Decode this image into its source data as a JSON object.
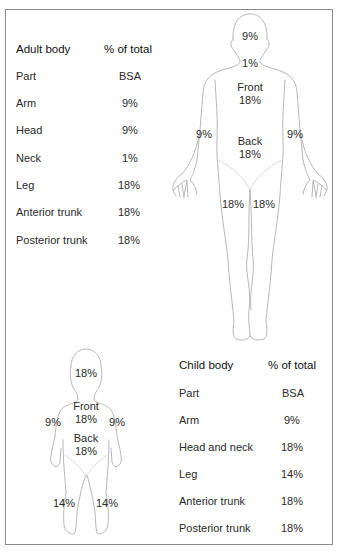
{
  "adult_table": {
    "header": {
      "part": "Adult body",
      "value": "% of total"
    },
    "subheader": {
      "part": "Part",
      "value": "BSA"
    },
    "rows": [
      {
        "part": "Arm",
        "value": "9%"
      },
      {
        "part": "Head",
        "value": "9%"
      },
      {
        "part": "Neck",
        "value": "1%"
      },
      {
        "part": "Leg",
        "value": "18%"
      },
      {
        "part": "Anterior trunk",
        "value": "18%"
      },
      {
        "part": "Posterior trunk",
        "value": "18%"
      }
    ]
  },
  "child_table": {
    "header": {
      "part": "Child body",
      "value": "% of total"
    },
    "subheader": {
      "part": "Part",
      "value": "BSA"
    },
    "rows": [
      {
        "part": "Arm",
        "value": "9%"
      },
      {
        "part": "Head and neck",
        "value": "18%"
      },
      {
        "part": "Leg",
        "value": "14%"
      },
      {
        "part": "Anterior trunk",
        "value": "18%"
      },
      {
        "part": "Posterior trunk",
        "value": "18%"
      }
    ]
  },
  "adult_figure": {
    "head": "9%",
    "neck": "1%",
    "front_label": "Front",
    "front_value": "18%",
    "back_label": "Back",
    "back_value": "18%",
    "left_arm": "9%",
    "right_arm": "9%",
    "left_leg": "18%",
    "right_leg": "18%"
  },
  "child_figure": {
    "head": "18%",
    "front_label": "Front",
    "front_value": "18%",
    "back_label": "Back",
    "back_value": "18%",
    "left_arm": "9%",
    "right_arm": "9%",
    "left_leg": "14%",
    "right_leg": "14%"
  }
}
